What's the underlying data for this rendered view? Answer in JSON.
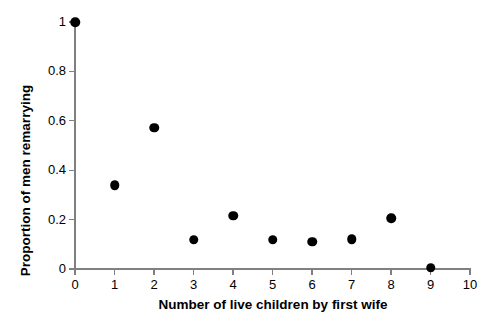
{
  "chart_data": {
    "type": "scatter",
    "title": "",
    "xlabel": "Number of live children by first wife",
    "ylabel": "Proportion of men remarrying",
    "x": [
      0,
      1,
      2,
      3,
      4,
      5,
      6,
      7,
      8,
      9
    ],
    "values": [
      1.0,
      0.34,
      0.571,
      0.118,
      0.215,
      0.118,
      0.11,
      0.12,
      0.206,
      0.005
    ],
    "xlim": [
      0,
      10
    ],
    "ylim": [
      0,
      1
    ],
    "xticks": [
      0,
      1,
      2,
      3,
      4,
      5,
      6,
      7,
      8,
      9,
      10
    ],
    "xticklabels": [
      "0",
      "1",
      "2",
      "3",
      "4",
      "5",
      "6",
      "7",
      "8",
      "9",
      "10"
    ],
    "yticks": [
      0,
      0.2,
      0.4,
      0.6,
      0.8,
      1.0
    ],
    "yticklabels": [
      "0",
      "0.2",
      "0.4",
      "0.6",
      "0.8",
      "1"
    ],
    "grid": false,
    "legend": false,
    "marker": "filled-circle",
    "marker_color": "#000000",
    "axis_color": "#808080",
    "background_color": "#ffffff"
  }
}
